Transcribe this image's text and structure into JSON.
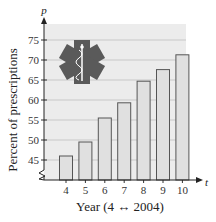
{
  "chart_data": {
    "type": "bar",
    "title": "",
    "xlabel": "Year (4 ↔ 2004)",
    "ylabel": "Percent of prescriptions",
    "x_axis_variable": "t",
    "y_axis_variable": "p",
    "categories": [
      "4",
      "5",
      "6",
      "7",
      "8",
      "9",
      "10"
    ],
    "values": [
      46.0,
      49.5,
      55.5,
      59.3,
      64.7,
      67.6,
      71.3
    ],
    "yticks": [
      45,
      50,
      55,
      60,
      65,
      70,
      75
    ],
    "ylim": [
      43,
      78
    ],
    "grid": true,
    "axis_break": true,
    "legend": null,
    "decoration": "star-of-life-icon",
    "colors": {
      "plot_background": "#ececec",
      "bar_fill": "#e0e0e0",
      "bar_stroke": "#555555",
      "gridline": "#c8c8c8",
      "icon": "#5a5a5a"
    }
  }
}
